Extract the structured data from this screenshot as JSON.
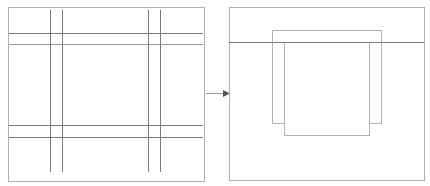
{
  "diagram": {
    "colors": {
      "background": "#ffffff",
      "frame_stroke": "#b0b0b0",
      "grid_stroke": "#7a7a7a",
      "grid_stroke_light": "#9a9a9a",
      "rect_stroke": "#b4b4b4",
      "arrow": "#555555"
    },
    "left_panel": {
      "frame": {
        "x": 8.5,
        "y": 7.5,
        "w": 196,
        "h": 174
      },
      "vertical_lines": [
        {
          "x": 50.5,
          "y1": 10,
          "y2": 172
        },
        {
          "x": 62.5,
          "y1": 10,
          "y2": 172
        },
        {
          "x": 148.5,
          "y1": 10,
          "y2": 172
        },
        {
          "x": 160.5,
          "y1": 10,
          "y2": 172
        }
      ],
      "horizontal_lines": [
        {
          "y": 33.5,
          "x1": 9,
          "x2": 203,
          "light": false
        },
        {
          "y": 44.5,
          "x1": 9,
          "x2": 203,
          "light": true
        },
        {
          "y": 125.5,
          "x1": 9,
          "x2": 203,
          "light": false
        },
        {
          "y": 137.5,
          "x1": 9,
          "x2": 203,
          "light": false
        }
      ]
    },
    "arrow": {
      "x1": 206,
      "y1": 93.5,
      "x2": 230,
      "y2": 93.5
    },
    "right_panel": {
      "frame": {
        "x": 229.5,
        "y": 7.5,
        "w": 195,
        "h": 173
      },
      "horizontal_lines": [
        {
          "y": 42.5,
          "x1": 229,
          "x2": 424
        }
      ],
      "rectangles": [
        {
          "name": "back-rectangle",
          "x": 272.5,
          "y": 30.5,
          "w": 109,
          "h": 93
        },
        {
          "name": "front-rectangle",
          "x": 284.5,
          "y": 42.5,
          "w": 85,
          "h": 93
        }
      ]
    }
  }
}
